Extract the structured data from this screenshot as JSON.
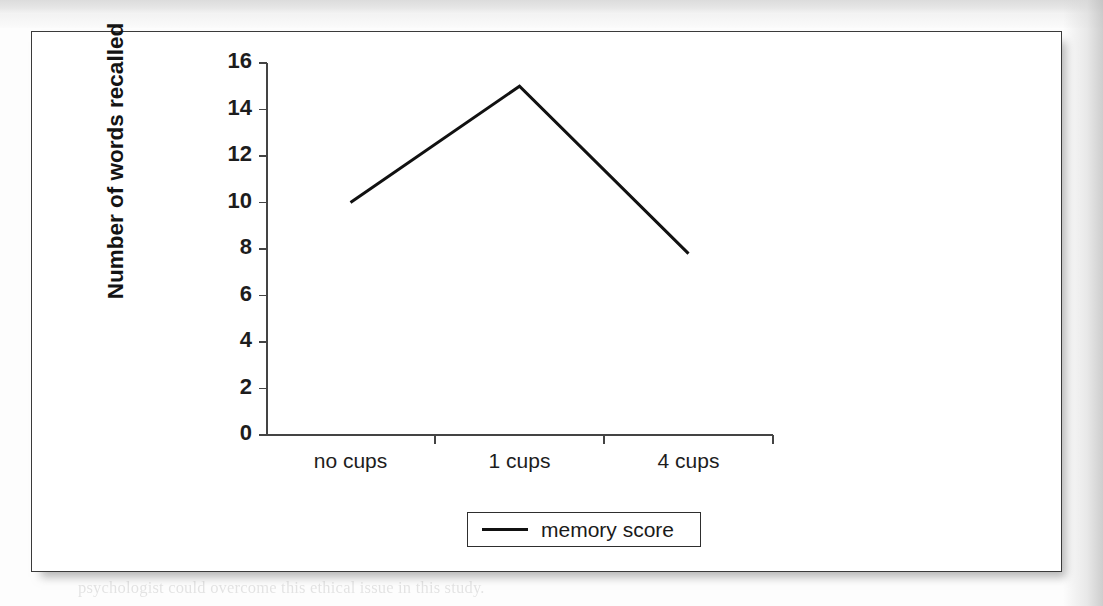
{
  "figure": {
    "background_color": "#ffffff",
    "border_color": "#3a3a3a"
  },
  "chart_data": {
    "type": "line",
    "title": "",
    "subtitle": "",
    "xlabel": "",
    "ylabel": "Number of words recalled",
    "categories": [
      "no cups",
      "1 cups",
      "4 cups"
    ],
    "series": [
      {
        "name": "memory score",
        "values": [
          10,
          15,
          7.8
        ],
        "color": "#111111",
        "line_width": 3
      }
    ],
    "ytick_labels": [
      "16",
      "14",
      "12",
      "10",
      "8",
      "6",
      "4",
      "2",
      "0"
    ],
    "yticks": [
      16,
      14,
      12,
      10,
      8,
      6,
      4,
      2,
      0
    ],
    "ylim": [
      0,
      16
    ],
    "grid": false,
    "legend": {
      "entries": [
        "memory score"
      ],
      "position": "bottom-center",
      "border": true
    }
  },
  "legend": {
    "label": "memory score",
    "marker": "line-swatch"
  },
  "axis": {
    "y_title": "Number of words recalled"
  },
  "ghost_text": [
    {
      "x": 78,
      "y": 58,
      "text": "in two different conditions. These were: (a) feel only, (b) a comparison condition"
    },
    {
      "x": 92,
      "y": 86,
      "text": "in which the same conditions were used."
    },
    {
      "x": 78,
      "y": 144,
      "text": "participants were asked to recall as many of the words as they could after"
    },
    {
      "x": 78,
      "y": 181,
      "text": "the list had been presented. The number of words correctly recalled in the"
    },
    {
      "x": 78,
      "y": 216,
      "text": "different conditions was recorded. The results are shown in the graph below."
    },
    {
      "x": 78,
      "y": 250,
      "text": "( )  Identify the experimental design used in this study."
    },
    {
      "x": 140,
      "y": 292,
      "text": "Describe the sampling technique used and explain one"
    },
    {
      "x": 140,
      "y": 330,
      "text": "limitation of using this sampling technique in this study."
    },
    {
      "x": 78,
      "y": 363,
      "text": "Sketch the graph and explain what the results of the experiment show"
    },
    {
      "x": 78,
      "y": 396,
      "text": "about the effect of the number of cups of coffee on memory."
    },
    {
      "x": 78,
      "y": 430,
      "text": "Identify the independent variable and the dependent variable in this study."
    },
    {
      "x": 78,
      "y": 462,
      "text": "Outline the conclusion the psychologist might draw from these results."
    },
    {
      "x": 78,
      "y": 494,
      "text": "Explain how the psychologist could improve the reliability of this study."
    },
    {
      "x": 78,
      "y": 528,
      "text": "Describe one ethical issue that may have arisen in this investigation."
    },
    {
      "x": 78,
      "y": 568,
      "text": "psychologist could overcome this ethical issue in this study."
    }
  ]
}
